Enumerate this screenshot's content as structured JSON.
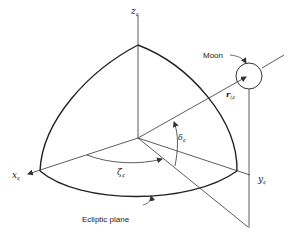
{
  "diagram": {
    "type": "3d-coordinate-octant",
    "colors": {
      "line": "#333333",
      "background": "#ffffff"
    },
    "axes": {
      "z": {
        "label": "z",
        "subscript": "¢"
      },
      "x": {
        "label": "x",
        "subscript": "¢"
      },
      "y": {
        "label": "y",
        "subscript": "¢"
      }
    },
    "labels": {
      "moon": "Moon",
      "ecliptic_plane": "Ecliptic plane",
      "r_vector": "r",
      "r_subscript": "(¢",
      "zeta": "ζ",
      "zeta_subscript": "¢",
      "delta": "δ",
      "delta_subscript": "¢"
    }
  }
}
